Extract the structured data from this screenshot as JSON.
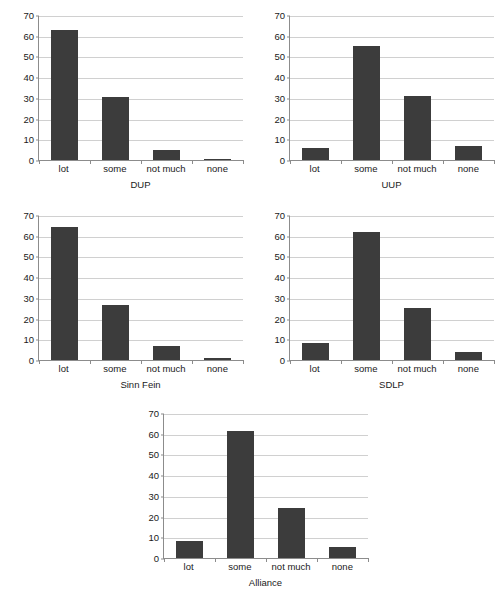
{
  "chart_data": [
    {
      "type": "bar",
      "title": "",
      "xlabel": "DUP",
      "ylabel": "",
      "categories": [
        "lot",
        "some",
        "not much",
        "none"
      ],
      "values": [
        63,
        30.5,
        5,
        0.6
      ],
      "ylim": [
        0,
        70
      ],
      "yticks": [
        0,
        10,
        20,
        30,
        40,
        50,
        60,
        70
      ],
      "grid": true,
      "legend": "none",
      "bar_color": "#3c3c3c"
    },
    {
      "type": "bar",
      "title": "",
      "xlabel": "UUP",
      "ylabel": "",
      "categories": [
        "lot",
        "some",
        "not much",
        "none"
      ],
      "values": [
        6,
        55,
        31,
        7
      ],
      "ylim": [
        0,
        70
      ],
      "yticks": [
        0,
        10,
        20,
        30,
        40,
        50,
        60,
        70
      ],
      "grid": true,
      "legend": "none",
      "bar_color": "#3c3c3c"
    },
    {
      "type": "bar",
      "title": "",
      "xlabel": "Sinn Fein",
      "ylabel": "",
      "categories": [
        "lot",
        "some",
        "not much",
        "none"
      ],
      "values": [
        64,
        26.5,
        7,
        1
      ],
      "ylim": [
        0,
        70
      ],
      "yticks": [
        0,
        10,
        20,
        30,
        40,
        50,
        60,
        70
      ],
      "grid": true,
      "legend": "none",
      "bar_color": "#3c3c3c"
    },
    {
      "type": "bar",
      "title": "",
      "xlabel": "SDLP",
      "ylabel": "",
      "categories": [
        "lot",
        "some",
        "not much",
        "none"
      ],
      "values": [
        8,
        62,
        25,
        4
      ],
      "ylim": [
        0,
        70
      ],
      "yticks": [
        0,
        10,
        20,
        30,
        40,
        50,
        60,
        70
      ],
      "grid": true,
      "legend": "none",
      "bar_color": "#3c3c3c"
    },
    {
      "type": "bar",
      "title": "",
      "xlabel": "Alliance",
      "ylabel": "",
      "categories": [
        "lot",
        "some",
        "not much",
        "none"
      ],
      "values": [
        8,
        61.5,
        24,
        5.5
      ],
      "ylim": [
        0,
        70
      ],
      "yticks": [
        0,
        10,
        20,
        30,
        40,
        50,
        60,
        70
      ],
      "grid": true,
      "legend": "none",
      "bar_color": "#3c3c3c"
    }
  ]
}
